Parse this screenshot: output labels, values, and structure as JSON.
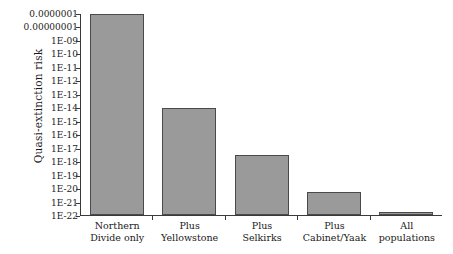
{
  "chart_data": {
    "type": "bar",
    "title": "",
    "xlabel": "",
    "ylabel": "Quasi-extinction risk",
    "yscale": "log",
    "ylim": [
      1e-22,
      1e-07
    ],
    "grid": false,
    "legend": false,
    "categories": [
      "Northern Divide only",
      "Plus Yellowstone",
      "Plus Selkirks",
      "Plus Cabinet/Yaak",
      "All populations"
    ],
    "category_lines": [
      [
        "Northern",
        "Divide only"
      ],
      [
        "Plus",
        "Yellowstone"
      ],
      [
        "Plus",
        "Selkirks"
      ],
      [
        "Plus",
        "Cabinet/Yaak"
      ],
      [
        "All",
        "populations"
      ]
    ],
    "values": [
      1e-07,
      1e-14,
      3.2e-18,
      5e-21,
      1.6e-22
    ],
    "value_exponents": [
      -7.0,
      -14.0,
      -17.5,
      -20.3,
      -21.8
    ],
    "ytick_labels": [
      "0.0000001",
      "0.00000001",
      "1E-09",
      "1E-10",
      "1E-11",
      "1E-12",
      "1E-13",
      "1E-14",
      "1E-15",
      "1E-16",
      "1E-17",
      "1E-18",
      "1E-19",
      "1E-20",
      "1E-21",
      "1E-22"
    ],
    "ytick_exponents": [
      -7,
      -8,
      -9,
      -10,
      -11,
      -12,
      -13,
      -14,
      -15,
      -16,
      -17,
      -18,
      -19,
      -20,
      -21,
      -22
    ],
    "colors": {
      "bar_fill": "#9a9a9a",
      "bar_border": "#4a4a4a",
      "axis": "#3a3a3a",
      "text": "#1a1a1a",
      "background": "#ffffff"
    }
  }
}
